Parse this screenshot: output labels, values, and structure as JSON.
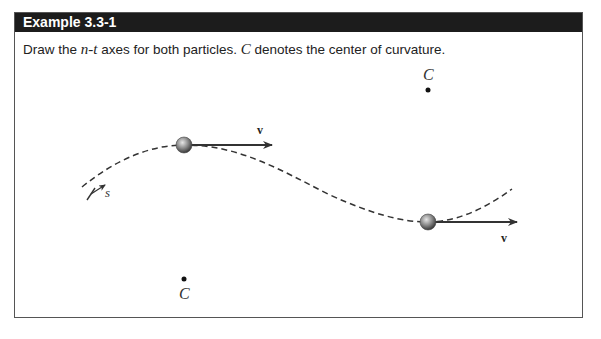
{
  "example": {
    "title": "Example 3.3-1",
    "prompt_pre": "Draw the ",
    "prompt_var": "n-t",
    "prompt_mid": " axes for both particles.  ",
    "prompt_c": "C",
    "prompt_post": " denotes the center of curvature."
  },
  "figure": {
    "path_label": "s",
    "particles": [
      {
        "velocity_label": "v",
        "center_label": "C"
      },
      {
        "velocity_label": "v",
        "center_label": "C"
      }
    ],
    "colors": {
      "header_bg": "#1c1c1c",
      "border": "#555555",
      "curve": "#333333"
    }
  }
}
